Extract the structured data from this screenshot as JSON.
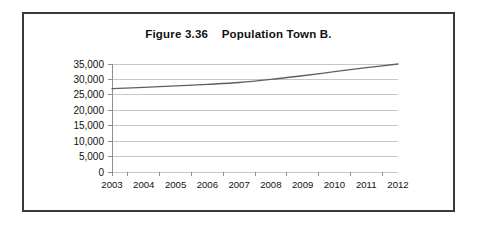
{
  "figure": {
    "title": "Figure 3.36    Population Town B."
  },
  "chart_data": {
    "type": "line",
    "title": "Figure 3.36    Population Town B.",
    "xlabel": "",
    "ylabel": "",
    "x": [
      2003,
      2004,
      2005,
      2006,
      2007,
      2008,
      2009,
      2010,
      2011,
      2012
    ],
    "categories": [
      "2003",
      "2004",
      "2005",
      "2006",
      "2007",
      "2008",
      "2009",
      "2010",
      "2011",
      "2012"
    ],
    "values": [
      27000,
      27400,
      27900,
      28400,
      29000,
      30000,
      31200,
      32500,
      33800,
      35000
    ],
    "series": [
      {
        "name": "Population Town B.",
        "values": [
          27000,
          27400,
          27900,
          28400,
          29000,
          30000,
          31200,
          32500,
          33800,
          35000
        ],
        "color": "#5f5f5f"
      }
    ],
    "ylim": [
      0,
      35000
    ],
    "ytick_values": [
      0,
      5000,
      10000,
      15000,
      20000,
      25000,
      30000,
      35000
    ],
    "ytick_labels": [
      "0",
      "5,000",
      "10,000",
      "15,000",
      "20,000",
      "25,000",
      "30,000",
      "35,000"
    ],
    "xtick_labels": [
      "2003",
      "2004",
      "2005",
      "2006",
      "2007",
      "2008",
      "2009",
      "2010",
      "2011",
      "2012"
    ],
    "grid": true,
    "grid_axis": "y",
    "legend": false,
    "legend_position": "none"
  },
  "colors": {
    "frame": "#3a3a3a",
    "grid": "#b9b9b9",
    "axis": "#8f8f8f",
    "line": "#5f5f5f",
    "text": "#111111",
    "background": "#ffffff"
  }
}
